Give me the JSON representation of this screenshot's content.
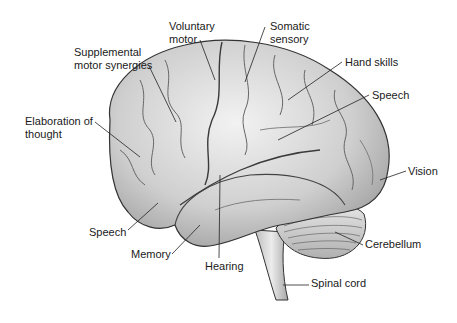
{
  "diagram": {
    "labels": [
      {
        "id": "voluntary-motor",
        "lines": [
          "Voluntary",
          "motor"
        ],
        "x": 169,
        "y": 20
      },
      {
        "id": "somatic-sensory",
        "lines": [
          "Somatic",
          "sensory"
        ],
        "x": 270,
        "y": 20
      },
      {
        "id": "supplemental-motor-synergies",
        "lines": [
          "Supplemental",
          "motor synergies"
        ],
        "x": 74,
        "y": 46
      },
      {
        "id": "hand-skills",
        "lines": [
          "Hand skills"
        ],
        "x": 345,
        "y": 56
      },
      {
        "id": "speech-upper",
        "lines": [
          "Speech"
        ],
        "x": 372,
        "y": 89
      },
      {
        "id": "elaboration-of-thought",
        "lines": [
          "Elaboration of",
          "thought"
        ],
        "x": 25,
        "y": 115
      },
      {
        "id": "vision",
        "lines": [
          "Vision"
        ],
        "x": 408,
        "y": 165
      },
      {
        "id": "speech-lower",
        "lines": [
          "Speech"
        ],
        "x": 89,
        "y": 226
      },
      {
        "id": "memory",
        "lines": [
          "Memory"
        ],
        "x": 131,
        "y": 248
      },
      {
        "id": "hearing",
        "lines": [
          "Hearing"
        ],
        "x": 205,
        "y": 260
      },
      {
        "id": "cerebellum",
        "lines": [
          "Cerebellum"
        ],
        "x": 365,
        "y": 238
      },
      {
        "id": "spinal-cord",
        "lines": [
          "Spinal cord"
        ],
        "x": 311,
        "y": 277
      }
    ]
  }
}
